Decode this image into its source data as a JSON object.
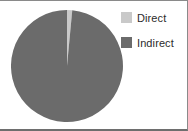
{
  "chart_data": {
    "type": "pie",
    "title": "",
    "categories": [
      "Direct",
      "Indirect"
    ],
    "values": [
      1.5,
      98.5
    ],
    "colors": [
      "#c9c9c9",
      "#6b6b6b"
    ],
    "legend_position": "right",
    "grid": false,
    "start_angle_deg": 90,
    "direction": "clockwise",
    "slices": [
      {
        "label": "Direct",
        "value": 1.5,
        "color": "#c9c9c9"
      },
      {
        "label": "Indirect",
        "value": 98.5,
        "color": "#6b6b6b"
      }
    ]
  },
  "legend": {
    "items": [
      {
        "label": "Direct",
        "swatch_color": "#c9c9c9"
      },
      {
        "label": "Indirect",
        "swatch_color": "#6b6b6b"
      }
    ]
  },
  "frame": {
    "border_color": "#8a8a8a",
    "background": "#ffffff"
  }
}
